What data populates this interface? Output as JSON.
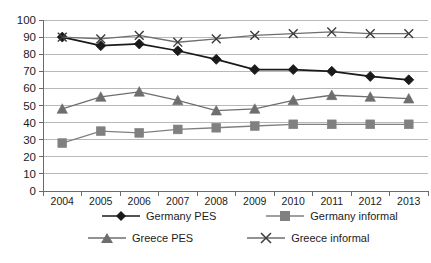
{
  "chart_data": {
    "type": "line",
    "title": "",
    "subtitle": "",
    "xlabel": "",
    "ylabel": "",
    "categories": [
      "2004",
      "2005",
      "2006",
      "2007",
      "2008",
      "2009",
      "2010",
      "2011",
      "2012",
      "2013"
    ],
    "ylim": [
      0,
      100
    ],
    "ytick_step": 10,
    "yticks": [
      "0",
      "10",
      "20",
      "30",
      "40",
      "50",
      "60",
      "70",
      "80",
      "90",
      "100"
    ],
    "grid": true,
    "legend_position": "bottom",
    "series": [
      {
        "name": "Germany PES",
        "marker": "diamond",
        "color": "#1a1a1a",
        "values": [
          90,
          85,
          86,
          82,
          77,
          71,
          71,
          70,
          67,
          65
        ]
      },
      {
        "name": "Germany informal",
        "marker": "square",
        "color": "#808080",
        "values": [
          28,
          35,
          34,
          36,
          37,
          38,
          39,
          39,
          39,
          39
        ]
      },
      {
        "name": "Greece PES",
        "marker": "triangle",
        "color": "#6e6e6e",
        "values": [
          48,
          55,
          58,
          53,
          47,
          48,
          53,
          56,
          55,
          54
        ]
      },
      {
        "name": "Greece informal",
        "marker": "cross",
        "color": "#6e6e6e",
        "values": [
          90,
          89,
          91,
          87,
          89,
          91,
          92,
          93,
          92,
          92
        ]
      }
    ]
  },
  "legend": {
    "items": [
      {
        "label": "Germany PES"
      },
      {
        "label": "Germany informal"
      },
      {
        "label": "Greece PES"
      },
      {
        "label": "Greece informal"
      }
    ]
  },
  "colors": {
    "germany_pes": "#1a1a1a",
    "germany_informal": "#808080",
    "greece_pes": "#6e6e6e",
    "greece_informal": "#6e6e6e",
    "gridline": "#b8b8b8",
    "axis": "#6b6b6b",
    "background": "#ffffff"
  }
}
